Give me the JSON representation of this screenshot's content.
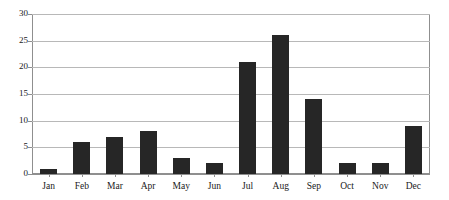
{
  "chart_data": {
    "type": "bar",
    "title": "",
    "subtitle": "",
    "xlabel": "",
    "ylabel": "",
    "categories": [
      "Jan",
      "Feb",
      "Mar",
      "Apr",
      "May",
      "Jun",
      "Jul",
      "Aug",
      "Sep",
      "Oct",
      "Nov",
      "Dec"
    ],
    "values": [
      1,
      6,
      7,
      8,
      3,
      2,
      21,
      26,
      14,
      2,
      2,
      9
    ],
    "ylim": [
      0,
      30
    ],
    "yticks": [
      0,
      5,
      10,
      15,
      20,
      25,
      30
    ],
    "ytick_labels": [
      "0",
      "5",
      "10",
      "15",
      "20",
      "25",
      "30"
    ],
    "grid": true,
    "grid_axis": "y",
    "legend": false,
    "legend_position": "none",
    "bar_color": "#262626",
    "grid_color": "#b8b8b8",
    "frame_color": "#8f8f8f",
    "background_color": "#ffffff",
    "text_color": "#1a1a1a"
  }
}
